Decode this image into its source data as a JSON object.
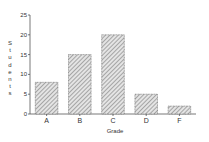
{
  "chart_data": {
    "type": "bar",
    "title": "",
    "xlabel": "Grade",
    "ylabel": "Students",
    "categories": [
      "A",
      "B",
      "C",
      "D",
      "F"
    ],
    "values": [
      8,
      15,
      20,
      5,
      2
    ],
    "ylim": [
      0,
      25
    ],
    "yticks": [
      0,
      5,
      10,
      15,
      20,
      25
    ],
    "grid": false,
    "legend": null,
    "bar_style": {
      "fill": "hatched",
      "hatch_color": "#777777",
      "edge_color": "#555555"
    }
  }
}
